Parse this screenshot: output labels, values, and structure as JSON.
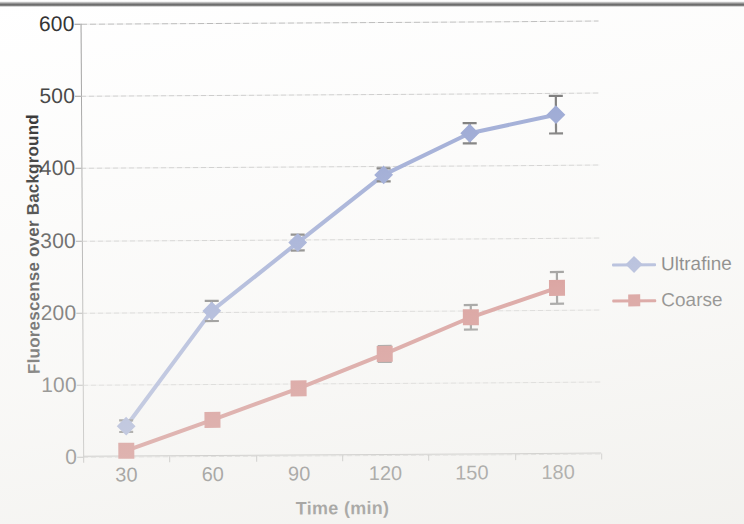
{
  "chart_data": {
    "type": "line",
    "title": "",
    "xlabel": "Time (min)",
    "ylabel": "Fluorescense over Background",
    "categories": [
      "30",
      "60",
      "90",
      "120",
      "150",
      "180"
    ],
    "x": [
      30,
      60,
      90,
      120,
      150,
      180
    ],
    "xlim": [
      30,
      180
    ],
    "ylim": [
      0,
      600
    ],
    "ytick_labels": [
      "0",
      "100",
      "200",
      "300",
      "400",
      "500",
      "600"
    ],
    "yticks": [
      0,
      100,
      200,
      300,
      400,
      500,
      600
    ],
    "grid": "horizontal",
    "legend_position": "right",
    "series": [
      {
        "name": "Ultrafine",
        "color": "#7D8FCB",
        "marker": "diamond",
        "values": [
          42,
          201,
          295,
          388,
          445,
          470
        ],
        "error": [
          8,
          14,
          11,
          9,
          14,
          26
        ]
      },
      {
        "name": "Coarse",
        "color": "#C0504D",
        "marker": "square",
        "values": [
          8,
          50,
          93,
          140,
          190,
          230
        ],
        "error": [
          5,
          5,
          7,
          11,
          17,
          22
        ]
      }
    ]
  },
  "legend": {
    "items": [
      {
        "label": "Ultrafine",
        "color": "#7D8FCB",
        "marker": "diamond"
      },
      {
        "label": "Coarse",
        "color": "#C0504D",
        "marker": "square"
      }
    ]
  },
  "axes": {
    "x_title": "Time (min)",
    "y_title": "Fluorescense over Background"
  }
}
